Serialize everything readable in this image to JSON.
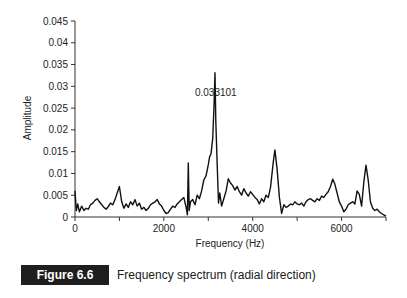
{
  "chart_data": {
    "type": "line",
    "title": "",
    "xlabel": "Frequency (Hz)",
    "ylabel": "Amplitude",
    "xlim": [
      0,
      7000
    ],
    "ylim": [
      0,
      0.045
    ],
    "x_ticks": [
      0,
      1000,
      2000,
      3000,
      4000,
      5000,
      6000,
      7000
    ],
    "x_tick_labels": [
      "0",
      "2000",
      "4000",
      "6000"
    ],
    "y_ticks": [
      0,
      0.005,
      0.01,
      0.015,
      0.02,
      0.025,
      0.03,
      0.035,
      0.04,
      0.045
    ],
    "y_tick_labels": [
      "0",
      "0.005",
      "0.01",
      "0.015",
      "0.02",
      "0.025",
      "0.03",
      "0.035",
      "0.04",
      "0.045"
    ],
    "grid": false,
    "legend": null,
    "annotations": [
      {
        "text": "0.033101",
        "x": 3150,
        "y": 0.033101
      }
    ],
    "series": [
      {
        "name": "Radial frequency spectrum",
        "x": [
          0,
          30,
          60,
          100,
          150,
          200,
          250,
          300,
          350,
          400,
          450,
          500,
          550,
          600,
          650,
          700,
          750,
          800,
          850,
          900,
          950,
          1000,
          1050,
          1100,
          1150,
          1200,
          1250,
          1300,
          1350,
          1400,
          1450,
          1500,
          1550,
          1600,
          1650,
          1700,
          1750,
          1800,
          1850,
          1900,
          1950,
          2000,
          2050,
          2100,
          2150,
          2200,
          2250,
          2300,
          2350,
          2400,
          2450,
          2500,
          2530,
          2550,
          2570,
          2600,
          2650,
          2700,
          2750,
          2800,
          2850,
          2900,
          2950,
          3000,
          3030,
          3060,
          3100,
          3130,
          3150,
          3170,
          3200,
          3230,
          3260,
          3300,
          3350,
          3400,
          3450,
          3500,
          3550,
          3600,
          3650,
          3700,
          3750,
          3800,
          3850,
          3900,
          3950,
          4000,
          4050,
          4100,
          4150,
          4200,
          4250,
          4300,
          4350,
          4400,
          4430,
          4460,
          4500,
          4550,
          4600,
          4650,
          4700,
          4750,
          4800,
          4850,
          4900,
          4950,
          5000,
          5050,
          5100,
          5150,
          5200,
          5250,
          5300,
          5350,
          5400,
          5450,
          5500,
          5550,
          5600,
          5650,
          5700,
          5750,
          5800,
          5850,
          5900,
          5950,
          6000,
          6050,
          6100,
          6150,
          6200,
          6250,
          6300,
          6350,
          6400,
          6450,
          6500,
          6550,
          6600,
          6650,
          6700,
          6750,
          6800,
          6850,
          6900,
          6950,
          7000
        ],
        "y": [
          0.006,
          0.0015,
          0.003,
          0.0012,
          0.0025,
          0.0015,
          0.002,
          0.0018,
          0.0028,
          0.0032,
          0.0038,
          0.0042,
          0.0035,
          0.0028,
          0.0022,
          0.0018,
          0.0024,
          0.0032,
          0.0028,
          0.004,
          0.0055,
          0.007,
          0.0035,
          0.002,
          0.003,
          0.0022,
          0.0035,
          0.0028,
          0.004,
          0.0025,
          0.0032,
          0.0018,
          0.0022,
          0.0015,
          0.002,
          0.0028,
          0.0032,
          0.0035,
          0.004,
          0.003,
          0.0025,
          0.0015,
          0.0008,
          0.001,
          0.0018,
          0.0025,
          0.0022,
          0.003,
          0.0035,
          0.004,
          0.0045,
          0.0022,
          0.0005,
          0.0124,
          0.0015,
          0.0035,
          0.004,
          0.0028,
          0.005,
          0.0042,
          0.006,
          0.0085,
          0.0095,
          0.012,
          0.0138,
          0.0145,
          0.018,
          0.026,
          0.0331,
          0.022,
          0.012,
          0.0032,
          0.0055,
          0.0025,
          0.0042,
          0.006,
          0.0088,
          0.0078,
          0.0072,
          0.0062,
          0.007,
          0.0058,
          0.005,
          0.0065,
          0.0055,
          0.0048,
          0.0058,
          0.0052,
          0.0045,
          0.004,
          0.003,
          0.0042,
          0.0035,
          0.005,
          0.0045,
          0.0068,
          0.0095,
          0.0125,
          0.0154,
          0.011,
          0.0045,
          0.0008,
          0.0028,
          0.0022,
          0.0025,
          0.003,
          0.0028,
          0.0035,
          0.003,
          0.0028,
          0.0032,
          0.0025,
          0.0035,
          0.004,
          0.0042,
          0.0038,
          0.0035,
          0.0042,
          0.0038,
          0.0048,
          0.0045,
          0.0052,
          0.0058,
          0.007,
          0.0087,
          0.0075,
          0.0055,
          0.0035,
          0.0025,
          0.0012,
          0.0018,
          0.0028,
          0.0032,
          0.0035,
          0.003,
          0.006,
          0.0052,
          0.0025,
          0.008,
          0.0119,
          0.0085,
          0.0035,
          0.002,
          0.0015,
          0.0018,
          0.0012,
          0.0008,
          0.0005,
          0.0002
        ]
      }
    ]
  },
  "caption": {
    "figure_label": "Figure 6.6",
    "text": "Frequency spectrum (radial direction)"
  }
}
